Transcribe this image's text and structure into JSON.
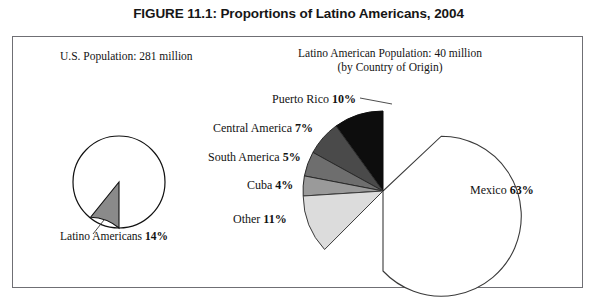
{
  "figure": {
    "title": "FIGURE 11.1: Proportions of Latino Americans, 2004"
  },
  "left_panel": {
    "caption": "U.S. Population: 281 million",
    "slice_label": "Latino Americans 14%"
  },
  "right_panel": {
    "caption_line1": "Latino American Population: 40 million",
    "caption_line2": "(by Country of Origin)",
    "labels": {
      "puerto_rico": "Puerto Rico 10%",
      "central_america": "Central America 7%",
      "south_america": "South America 5%",
      "cuba": "Cuba 4%",
      "other": "Other 11%",
      "mexico": "Mexico 63%"
    }
  },
  "chart_data": [
    {
      "type": "pie",
      "title": "U.S. Population: 281 million",
      "categories": [
        "Latino Americans",
        "Other U.S. Population"
      ],
      "values": [
        14,
        86
      ],
      "labels": [
        "Latino Americans 14%",
        ""
      ],
      "colors": [
        "#8a8a8a",
        "#ffffff"
      ],
      "units": "percent",
      "total_label": "281 million",
      "legend": "none",
      "grid": false,
      "start_angle_deg": 270,
      "direction": "counterclockwise"
    },
    {
      "type": "pie",
      "title": "Latino American Population: 40 million (by Country of Origin)",
      "categories": [
        "Mexico",
        "Puerto Rico",
        "Central America",
        "South America",
        "Cuba",
        "Other"
      ],
      "values": [
        63,
        10,
        7,
        5,
        4,
        11
      ],
      "labels": [
        "Mexico 63%",
        "Puerto Rico 10%",
        "Central America 7%",
        "South America 5%",
        "Cuba 4%",
        "Other 11%"
      ],
      "colors": [
        "#ffffff",
        "#0d0d0d",
        "#4a4a4a",
        "#6e6e6e",
        "#9a9a9a",
        "#dcdcdc"
      ],
      "units": "percent",
      "total_label": "40 million",
      "legend": "none",
      "grid": false,
      "start_angle_deg": 270,
      "direction": "counterclockwise"
    }
  ]
}
